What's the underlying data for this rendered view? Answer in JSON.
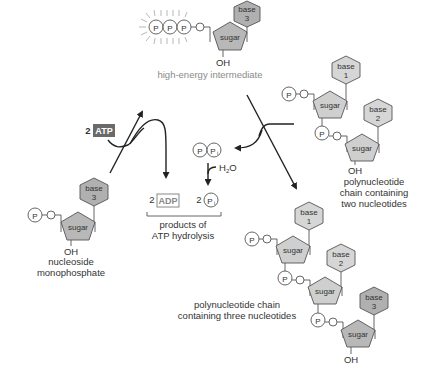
{
  "diagram": {
    "high_energy_intermediate": {
      "phosphates": [
        "P",
        "P",
        "P"
      ],
      "oxygen": "O",
      "sugar": "sugar",
      "base_label": "base",
      "base_number": "3",
      "hydroxyl": "OH",
      "caption": "high-energy intermediate"
    },
    "nucleoside_monophosphate": {
      "phosphate": "P",
      "oxygen": "O",
      "sugar": "sugar",
      "base_label": "base",
      "base_number": "3",
      "hydroxyl": "OH",
      "caption_line1": "nucleoside",
      "caption_line2": "monophosphate"
    },
    "atp_input": {
      "count": "2",
      "label": "ATP"
    },
    "pyrophosphate": {
      "p1": "P",
      "p2": "P",
      "p2_sub": "i"
    },
    "water": {
      "label": "H",
      "sub": "2",
      "tail": "O"
    },
    "products": {
      "adp_count": "2",
      "adp_label": "ADP",
      "pi_count": "2",
      "pi_label": "P",
      "pi_sub": "i",
      "caption_line1": "products of",
      "caption_line2": "ATP hydrolysis"
    },
    "chain_two": {
      "nucleotides": [
        {
          "phosphate": "P",
          "oxygen": "O",
          "sugar": "sugar",
          "base_label": "base",
          "base_number": "1"
        },
        {
          "phosphate": "P",
          "oxygen": "O",
          "sugar": "sugar",
          "base_label": "base",
          "base_number": "2"
        }
      ],
      "hydroxyl": "OH",
      "caption_line1": "polynucleotide",
      "caption_line2": "chain containing",
      "caption_line3": "two nucleotides"
    },
    "chain_three": {
      "nucleotides": [
        {
          "phosphate": "P",
          "oxygen": "O",
          "sugar": "sugar",
          "base_label": "base",
          "base_number": "1"
        },
        {
          "phosphate": "P",
          "oxygen": "O",
          "sugar": "sugar",
          "base_label": "base",
          "base_number": "2"
        },
        {
          "phosphate": "P",
          "oxygen": "O",
          "sugar": "sugar",
          "base_label": "base",
          "base_number": "3"
        }
      ],
      "hydroxyl": "OH",
      "caption_line1": "polynucleotide chain",
      "caption_line2": "containing three nucleotides"
    },
    "colors": {
      "base_light": "#d6d6d6",
      "base_dark": "#b0b0b0",
      "sugar": "#b8b8b8",
      "atp_box": "#6a6a6a",
      "caption_gray": "#8a8a8a",
      "arrow": "#222222"
    }
  }
}
